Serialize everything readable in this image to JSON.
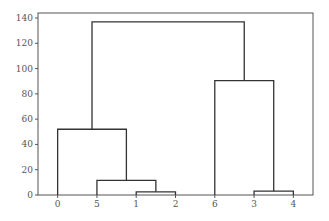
{
  "chart_data": {
    "type": "dendrogram",
    "title": "",
    "xlabel": "",
    "ylabel": "",
    "ylim": [
      0,
      143
    ],
    "yticks": [
      0,
      20,
      40,
      60,
      80,
      100,
      120,
      140
    ],
    "leaf_order": [
      "0",
      "5",
      "1",
      "2",
      "6",
      "3",
      "4"
    ],
    "merges": [
      {
        "left": "1",
        "right": "2",
        "height": 2.5
      },
      {
        "left": "3",
        "right": "4",
        "height": 3
      },
      {
        "left": "5",
        "right": "(1,2)",
        "height": 11.5
      },
      {
        "left": "0",
        "right": "(5,(1,2))",
        "height": 52
      },
      {
        "left": "6",
        "right": "(3,4)",
        "height": 90.5
      },
      {
        "left": "(0,(5,(1,2)))",
        "right": "(6,(3,4))",
        "height": 137
      }
    ],
    "line_color": "#333333",
    "axis_color": "#555555",
    "grid": false,
    "legend": null
  }
}
